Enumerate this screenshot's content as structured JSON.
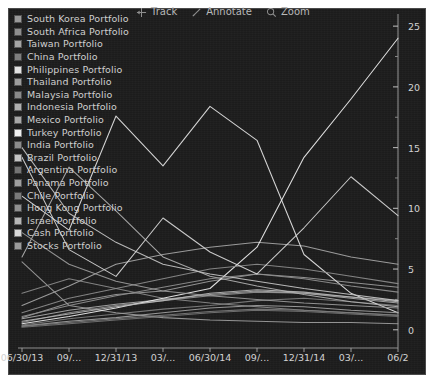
{
  "toolbar": {
    "items": [
      {
        "label": "Track",
        "icon": "crosshair-arrow-icon"
      },
      {
        "label": "Annotate",
        "icon": "pencil-icon"
      },
      {
        "label": "Zoom",
        "icon": "magnifier-icon"
      }
    ]
  },
  "legend": {
    "items": [
      {
        "label": "South Korea Portfolio",
        "color": "#9a9a9a"
      },
      {
        "label": "South Africa Portfolio",
        "color": "#8e8e8e"
      },
      {
        "label": "Taiwan Portfolio",
        "color": "#a5a5a5"
      },
      {
        "label": "China Portfolio",
        "color": "#7e7e7e"
      },
      {
        "label": "Philippines Portfolio",
        "color": "#e3e3e3"
      },
      {
        "label": "Thailand Portfolio",
        "color": "#9d9d9d"
      },
      {
        "label": "Malaysia Portfolio",
        "color": "#8a8a8a"
      },
      {
        "label": "Indonesia Portfolio",
        "color": "#b0b0b0"
      },
      {
        "label": "Mexico Portfolio",
        "color": "#a8a8a8"
      },
      {
        "label": "Turkey Portfolio",
        "color": "#efefef"
      },
      {
        "label": "India Portfolio",
        "color": "#8c8c8c"
      },
      {
        "label": "Brazil Portfolio",
        "color": "#c4c4c4"
      },
      {
        "label": "Argentina Portfolio",
        "color": "#747474"
      },
      {
        "label": "Panama Portfolio",
        "color": "#9f9f9f"
      },
      {
        "label": "Chile Portfolio",
        "color": "#7a7a7a"
      },
      {
        "label": "Hong Kong Portfolio",
        "color": "#8f8f8f"
      },
      {
        "label": "Israel Portfolio",
        "color": "#b6b6b6"
      },
      {
        "label": "Cash Portfolio",
        "color": "#d8d8d8"
      },
      {
        "label": "Stocks Portfolio",
        "color": "#9b9b9b"
      }
    ]
  },
  "chart_data": {
    "type": "line",
    "title": "",
    "xlabel": "",
    "ylabel": "",
    "grid": false,
    "legend_position": "top-left",
    "axis_position": {
      "y": "right",
      "x": "bottom"
    },
    "ylim": [
      -1.5,
      26
    ],
    "yticks": [
      0,
      5,
      10,
      15,
      20,
      25
    ],
    "yticklabels": [
      "0",
      "5",
      "10",
      "15",
      "20",
      "25"
    ],
    "yminor_ticks": [
      2.5,
      7.5,
      12.5,
      17.5,
      22.5
    ],
    "x": [
      "06/30/13",
      "09/30/13",
      "12/31/13",
      "03/31/14",
      "06/30/14",
      "09/30/14",
      "12/31/14",
      "03/31/15",
      "06/30/15"
    ],
    "xticklabels": [
      "06/30/13",
      "09/...",
      "12/31/13",
      "03/...",
      "06/30/14",
      "09/...",
      "12/31/14",
      "03/...",
      "06/2"
    ],
    "series": [
      {
        "name": "South Korea Portfolio",
        "color": "#9a9a9a",
        "values": [
          1.0,
          2.2,
          2.9,
          3.2,
          4.0,
          4.6,
          4.3,
          3.9,
          3.5
        ]
      },
      {
        "name": "South Africa Portfolio",
        "color": "#8e8e8e",
        "values": [
          0.6,
          1.4,
          2.0,
          2.4,
          2.8,
          3.1,
          3.0,
          2.7,
          2.4
        ]
      },
      {
        "name": "Taiwan Portfolio",
        "color": "#a5a5a5",
        "values": [
          2.0,
          3.6,
          5.4,
          6.2,
          6.8,
          7.2,
          6.9,
          6.0,
          5.4
        ]
      },
      {
        "name": "China Portfolio",
        "color": "#7e7e7e",
        "values": [
          0.4,
          0.9,
          1.3,
          1.7,
          2.0,
          2.4,
          2.6,
          2.3,
          2.0
        ]
      },
      {
        "name": "Philippines Portfolio",
        "color": "#e3e3e3",
        "values": [
          11.0,
          8.2,
          17.6,
          13.5,
          18.4,
          15.6,
          6.2,
          3.0,
          1.4
        ]
      },
      {
        "name": "Thailand Portfolio",
        "color": "#9d9d9d",
        "values": [
          5.6,
          2.0,
          1.4,
          1.0,
          0.8,
          0.7,
          0.6,
          0.6,
          0.5
        ]
      },
      {
        "name": "Malaysia Portfolio",
        "color": "#8a8a8a",
        "values": [
          3.0,
          4.2,
          3.4,
          2.6,
          2.2,
          1.9,
          1.6,
          1.4,
          1.2
        ]
      },
      {
        "name": "Indonesia Portfolio",
        "color": "#b0b0b0",
        "values": [
          6.0,
          13.4,
          9.8,
          6.0,
          4.4,
          3.6,
          2.9,
          2.3,
          1.9
        ]
      },
      {
        "name": "Mexico Portfolio",
        "color": "#a8a8a8",
        "values": [
          0.9,
          1.6,
          2.1,
          2.5,
          2.9,
          3.2,
          3.0,
          2.6,
          2.2
        ]
      },
      {
        "name": "Turkey Portfolio",
        "color": "#efefef",
        "values": [
          0.5,
          1.1,
          1.8,
          2.6,
          3.4,
          6.8,
          14.2,
          19.0,
          24.0
        ]
      },
      {
        "name": "India Portfolio",
        "color": "#8c8c8c",
        "values": [
          1.4,
          2.6,
          3.4,
          4.2,
          5.0,
          5.4,
          5.0,
          4.4,
          3.8
        ]
      },
      {
        "name": "Brazil Portfolio",
        "color": "#c4c4c4",
        "values": [
          15.0,
          9.6,
          7.2,
          5.4,
          4.6,
          4.0,
          3.4,
          2.9,
          2.4
        ]
      },
      {
        "name": "Argentina Portfolio",
        "color": "#747474",
        "values": [
          0.2,
          0.5,
          0.8,
          1.1,
          1.4,
          1.6,
          1.5,
          1.3,
          1.1
        ]
      },
      {
        "name": "Panama Portfolio",
        "color": "#9f9f9f",
        "values": [
          0.3,
          0.7,
          1.0,
          1.4,
          1.8,
          2.0,
          1.9,
          1.6,
          1.4
        ]
      },
      {
        "name": "Chile Portfolio",
        "color": "#7a7a7a",
        "values": [
          0.3,
          0.6,
          0.9,
          1.2,
          1.5,
          1.7,
          1.6,
          1.4,
          1.2
        ]
      },
      {
        "name": "Hong Kong Portfolio",
        "color": "#8f8f8f",
        "values": [
          1.1,
          2.0,
          2.8,
          3.5,
          4.2,
          4.6,
          4.2,
          3.6,
          3.1
        ]
      },
      {
        "name": "Israel Portfolio",
        "color": "#b6b6b6",
        "values": [
          0.7,
          1.3,
          1.9,
          2.4,
          3.0,
          3.3,
          3.1,
          2.7,
          2.3
        ]
      },
      {
        "name": "Cash Portfolio",
        "color": "#d8d8d8",
        "values": [
          14.2,
          6.6,
          4.4,
          9.2,
          6.4,
          4.6,
          8.4,
          12.6,
          9.4
        ]
      },
      {
        "name": "Stocks Portfolio",
        "color": "#9b9b9b",
        "values": [
          8.0,
          5.4,
          4.0,
          3.2,
          2.8,
          2.5,
          2.2,
          2.0,
          1.8
        ]
      }
    ]
  }
}
